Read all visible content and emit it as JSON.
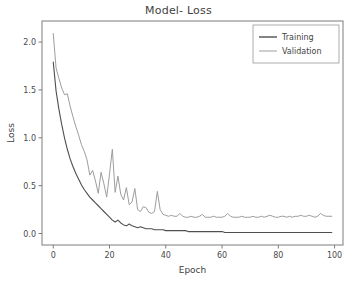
{
  "figure": {
    "title": "Model- Loss",
    "background": "#ffffff"
  },
  "axes": {
    "xlabel": "Epoch",
    "ylabel": "Loss",
    "x_ticks": [
      "0",
      "20",
      "40",
      "60",
      "80",
      "100"
    ],
    "y_ticks": [
      "0.0",
      "0.5",
      "1.0",
      "1.5",
      "2.0"
    ],
    "spine_color": "#7c7c7c"
  },
  "legend": {
    "position": "upper-right",
    "entries": [
      {
        "label": "Training",
        "color": "#4f4f4f"
      },
      {
        "label": "Validation",
        "color": "#9d9d9d"
      }
    ]
  },
  "chart_data": {
    "type": "line",
    "title": "Model- Loss",
    "xlabel": "Epoch",
    "ylabel": "Loss",
    "xlim": [
      -4,
      103
    ],
    "ylim": [
      -0.12,
      2.22
    ],
    "x_ticks": [
      0,
      20,
      40,
      60,
      80,
      100
    ],
    "y_ticks": [
      0.0,
      0.5,
      1.0,
      1.5,
      2.0
    ],
    "grid": false,
    "legend_position": "upper right",
    "x": [
      0,
      1,
      2,
      3,
      4,
      5,
      6,
      7,
      8,
      9,
      10,
      11,
      12,
      13,
      14,
      15,
      16,
      17,
      18,
      19,
      20,
      21,
      22,
      23,
      24,
      25,
      26,
      27,
      28,
      29,
      30,
      31,
      32,
      33,
      34,
      35,
      36,
      37,
      38,
      39,
      40,
      41,
      42,
      43,
      44,
      45,
      46,
      47,
      48,
      49,
      50,
      51,
      52,
      53,
      54,
      55,
      56,
      57,
      58,
      59,
      60,
      61,
      62,
      63,
      64,
      65,
      66,
      67,
      68,
      69,
      70,
      71,
      72,
      73,
      74,
      75,
      76,
      77,
      78,
      79,
      80,
      81,
      82,
      83,
      84,
      85,
      86,
      87,
      88,
      89,
      90,
      91,
      92,
      93,
      94,
      95,
      96,
      97,
      98,
      99
    ],
    "series": [
      {
        "name": "Training",
        "color": "#4f4f4f",
        "linewidth": 1.1,
        "values": [
          1.79,
          1.49,
          1.3,
          1.14,
          1.0,
          0.88,
          0.78,
          0.7,
          0.63,
          0.57,
          0.51,
          0.46,
          0.42,
          0.38,
          0.35,
          0.32,
          0.29,
          0.26,
          0.23,
          0.2,
          0.17,
          0.14,
          0.12,
          0.14,
          0.11,
          0.09,
          0.08,
          0.1,
          0.08,
          0.07,
          0.06,
          0.07,
          0.06,
          0.05,
          0.05,
          0.05,
          0.04,
          0.04,
          0.04,
          0.04,
          0.03,
          0.03,
          0.03,
          0.03,
          0.03,
          0.03,
          0.03,
          0.03,
          0.02,
          0.02,
          0.02,
          0.02,
          0.02,
          0.02,
          0.02,
          0.02,
          0.02,
          0.02,
          0.02,
          0.02,
          0.02,
          0.01,
          0.01,
          0.01,
          0.01,
          0.01,
          0.01,
          0.01,
          0.01,
          0.01,
          0.01,
          0.01,
          0.01,
          0.01,
          0.01,
          0.01,
          0.01,
          0.01,
          0.01,
          0.01,
          0.01,
          0.01,
          0.01,
          0.01,
          0.01,
          0.01,
          0.01,
          0.01,
          0.01,
          0.01,
          0.01,
          0.01,
          0.01,
          0.01,
          0.01,
          0.01,
          0.01,
          0.01,
          0.01,
          0.01
        ]
      },
      {
        "name": "Validation",
        "color": "#9d9d9d",
        "linewidth": 1.0,
        "values": [
          2.09,
          1.73,
          1.62,
          1.52,
          1.45,
          1.46,
          1.33,
          1.22,
          1.12,
          1.03,
          0.93,
          0.86,
          0.77,
          0.61,
          0.66,
          0.55,
          0.42,
          0.64,
          0.52,
          0.38,
          0.62,
          0.88,
          0.43,
          0.6,
          0.41,
          0.35,
          0.48,
          0.3,
          0.33,
          0.47,
          0.25,
          0.23,
          0.28,
          0.27,
          0.22,
          0.21,
          0.23,
          0.44,
          0.25,
          0.2,
          0.19,
          0.18,
          0.19,
          0.18,
          0.18,
          0.21,
          0.18,
          0.17,
          0.17,
          0.18,
          0.17,
          0.17,
          0.18,
          0.2,
          0.17,
          0.17,
          0.17,
          0.18,
          0.17,
          0.17,
          0.17,
          0.18,
          0.21,
          0.18,
          0.17,
          0.17,
          0.17,
          0.18,
          0.17,
          0.17,
          0.17,
          0.18,
          0.17,
          0.17,
          0.18,
          0.17,
          0.18,
          0.19,
          0.18,
          0.17,
          0.17,
          0.18,
          0.18,
          0.17,
          0.18,
          0.17,
          0.18,
          0.18,
          0.19,
          0.18,
          0.18,
          0.19,
          0.18,
          0.17,
          0.18,
          0.21,
          0.19,
          0.18,
          0.18,
          0.18
        ]
      }
    ]
  }
}
